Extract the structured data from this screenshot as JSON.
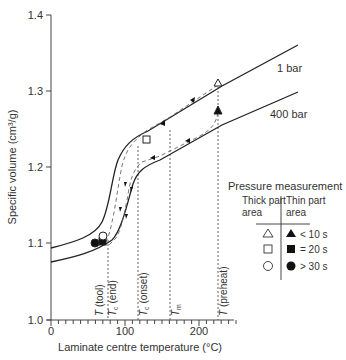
{
  "chart_data": {
    "type": "line",
    "title": "",
    "xlabel": "Laminate centre temperature (°C)",
    "ylabel": "Specific volume (cm³/g)",
    "xlim": [
      0,
      250
    ],
    "ylim": [
      1.0,
      1.4
    ],
    "xticks": [
      0,
      100,
      200
    ],
    "yticks": [
      1.0,
      1.1,
      1.2,
      1.3,
      1.4
    ],
    "grid": false,
    "series": [
      {
        "name": "1 bar",
        "style": "solid",
        "points": [
          [
            0,
            1.096
          ],
          [
            40,
            1.107
          ],
          [
            60,
            1.116
          ],
          [
            75,
            1.13
          ],
          [
            85,
            1.16
          ],
          [
            92,
            1.195
          ],
          [
            98,
            1.225
          ],
          [
            105,
            1.24
          ],
          [
            120,
            1.25
          ],
          [
            160,
            1.27
          ],
          [
            200,
            1.29
          ],
          [
            225,
            1.305
          ],
          [
            250,
            1.323
          ]
        ]
      },
      {
        "name": "400 bar",
        "style": "solid",
        "points": [
          [
            0,
            1.077
          ],
          [
            40,
            1.088
          ],
          [
            60,
            1.094
          ],
          [
            80,
            1.105
          ],
          [
            95,
            1.13
          ],
          [
            105,
            1.16
          ],
          [
            112,
            1.185
          ],
          [
            120,
            1.198
          ],
          [
            140,
            1.208
          ],
          [
            180,
            1.226
          ],
          [
            210,
            1.24
          ],
          [
            230,
            1.252
          ],
          [
            250,
            1.265
          ]
        ]
      }
    ],
    "process_paths": [
      {
        "name": "thick part area path",
        "style": "dashed",
        "points": [
          [
            225,
            1.31
          ],
          [
            160,
            1.275
          ],
          [
            120,
            1.25
          ],
          [
            105,
            1.235
          ],
          [
            98,
            1.19
          ],
          [
            90,
            1.15
          ],
          [
            82,
            1.115
          ]
        ]
      },
      {
        "name": "thin part area path",
        "style": "dashed",
        "points": [
          [
            225,
            1.27
          ],
          [
            218,
            1.25
          ],
          [
            180,
            1.225
          ],
          [
            130,
            1.205
          ],
          [
            112,
            1.185
          ],
          [
            103,
            1.15
          ],
          [
            95,
            1.13
          ],
          [
            85,
            1.105
          ]
        ]
      }
    ],
    "markers": [
      {
        "shape": "triangle",
        "filled": false,
        "x": 225,
        "y": 1.308
      },
      {
        "shape": "triangle",
        "filled": true,
        "x": 225,
        "y": 1.27
      },
      {
        "shape": "square",
        "filled": false,
        "x": 130,
        "y": 1.235
      },
      {
        "shape": "square",
        "filled": true,
        "x": 78,
        "y": 1.105
      },
      {
        "shape": "circle",
        "filled": false,
        "x": 75,
        "y": 1.112
      },
      {
        "shape": "circle",
        "filled": true,
        "x": 68,
        "y": 1.103
      }
    ],
    "vertical_lines": [
      {
        "label": "T (tool)",
        "x": 77
      },
      {
        "label": "Tc (end)",
        "x": 77
      },
      {
        "label": "Tc (onset)",
        "x": 118
      },
      {
        "label": "Tm",
        "x": 161
      },
      {
        "label": "T (preheat)",
        "x": 225
      }
    ],
    "annotations": [
      "1 bar",
      "400 bar"
    ],
    "legend": {
      "title": "Pressure measurement",
      "col_headers": [
        "Thick part area",
        "Thin part area"
      ],
      "rows": [
        {
          "thick": "open triangle",
          "thin": "filled triangle",
          "label": "< 10 s"
        },
        {
          "thick": "open square",
          "thin": "filled square",
          "label": "= 20 s"
        },
        {
          "thick": "open circle",
          "thin": "filled circle",
          "label": "> 30 s"
        }
      ],
      "position": "right-middle"
    }
  },
  "axes": {
    "xlabel": "Laminate centre temperature (°C)",
    "ylabel": "Specific volume (cm³/g)",
    "xtick_labels": [
      "0",
      "100",
      "200"
    ],
    "ytick_labels": [
      "1.0",
      "1.1",
      "1.2",
      "1.3",
      "1.4"
    ]
  },
  "curve_labels": {
    "low_pressure": "1 bar",
    "high_pressure": "400 bar"
  },
  "vlines": {
    "tool": {
      "main": "T",
      "rest": " (tool)"
    },
    "tc_end": {
      "main": "T",
      "sub": "c",
      "rest": " (end)"
    },
    "tc_onset": {
      "main": "T",
      "sub": "c",
      "rest": " (onset)"
    },
    "tm": {
      "main": "T",
      "sub": "m"
    },
    "preheat": {
      "main": "T",
      "rest": " (preheat)"
    }
  },
  "legend": {
    "title": "Pressure measurement",
    "thick_l1": "Thick part",
    "thick_l2": "area",
    "thin_l1": "Thin part",
    "thin_l2": "area",
    "row1": "< 10 s",
    "row2": "= 20 s",
    "row3": "> 30 s"
  }
}
